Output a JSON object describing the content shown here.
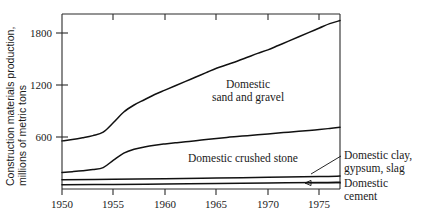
{
  "chart_data": {
    "type": "line",
    "title": "",
    "xlabel": "",
    "ylabel": "Construction materials production, millions of metric tons",
    "ylabel_line1": "Construction materials production,",
    "ylabel_line2": "millions of metric tons",
    "xlim": [
      1950,
      1977
    ],
    "ylim": [
      0,
      2000
    ],
    "yticks": [
      600,
      1200,
      1800
    ],
    "ytick_labels": [
      "600",
      "1200",
      "1800"
    ],
    "xticks": [
      1950,
      1955,
      1960,
      1965,
      1970,
      1975
    ],
    "xtick_labels": [
      "1950",
      "1955",
      "1960",
      "1965",
      "1970",
      "1975"
    ],
    "grid": false,
    "legend_position": "inline-annotations",
    "series": [
      {
        "name": "Domestic sand and gravel",
        "label": "Domestic sand and gravel",
        "label_line1": "Domestic",
        "label_line2": "sand and gravel",
        "color": "#111111",
        "x": [
          1950,
          1951,
          1952,
          1953,
          1954,
          1955,
          1956,
          1957,
          1958,
          1959,
          1960,
          1961,
          1962,
          1963,
          1964,
          1965,
          1966,
          1967,
          1968,
          1969,
          1970,
          1971,
          1972,
          1973,
          1974,
          1975,
          1976,
          1977
        ],
        "values": [
          550,
          565,
          585,
          610,
          650,
          760,
          880,
          960,
          1020,
          1080,
          1130,
          1180,
          1230,
          1280,
          1330,
          1380,
          1420,
          1460,
          1505,
          1550,
          1590,
          1640,
          1690,
          1740,
          1790,
          1840,
          1890,
          1925
        ]
      },
      {
        "name": "Domestic crushed stone",
        "label": "Domestic crushed stone",
        "color": "#111111",
        "x": [
          1950,
          1951,
          1952,
          1953,
          1954,
          1955,
          1956,
          1957,
          1958,
          1959,
          1960,
          1961,
          1962,
          1963,
          1964,
          1965,
          1966,
          1967,
          1968,
          1969,
          1970,
          1971,
          1972,
          1973,
          1974,
          1975,
          1976,
          1977
        ],
        "values": [
          190,
          198,
          208,
          222,
          245,
          330,
          410,
          455,
          480,
          500,
          515,
          528,
          540,
          552,
          565,
          578,
          590,
          600,
          610,
          620,
          630,
          640,
          650,
          660,
          670,
          680,
          692,
          705
        ]
      },
      {
        "name": "Domestic clay, gypsum, slag",
        "label": "Domestic clay, gypsum, slag",
        "label_line1": "Domestic clay,",
        "label_line2": "gypsum, slag",
        "color": "#111111",
        "x": [
          1950,
          1955,
          1960,
          1965,
          1970,
          1975,
          1977
        ],
        "values": [
          105,
          112,
          118,
          126,
          134,
          142,
          148
        ]
      },
      {
        "name": "Domestic cement",
        "label": "Domestic cement",
        "label_line1": "Domestic",
        "label_line2": "cement",
        "color": "#111111",
        "x": [
          1950,
          1955,
          1960,
          1965,
          1970,
          1975,
          1977
        ],
        "values": [
          48,
          52,
          58,
          64,
          70,
          74,
          78
        ]
      }
    ]
  }
}
